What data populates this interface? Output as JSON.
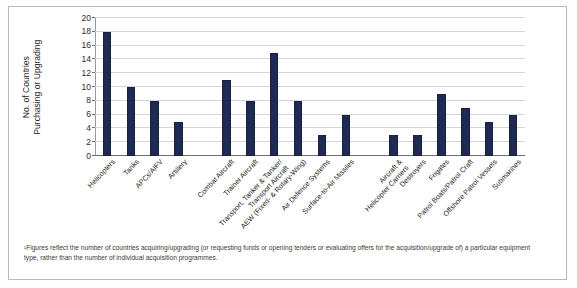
{
  "chart_data": {
    "type": "bar",
    "title": "",
    "xlabel": "",
    "ylabel": "No. of Countries Purchasing or Upgrading",
    "ylabel_lines": [
      "No. of Countries",
      "Purchasing or Upgrading"
    ],
    "ylim": [
      0,
      20
    ],
    "ytick_step": 2,
    "yticks": [
      0,
      2,
      4,
      6,
      8,
      10,
      12,
      14,
      16,
      18,
      20
    ],
    "ytick_labels": [
      "0",
      "2",
      "4",
      "6",
      "8",
      "10",
      "12",
      "14",
      "16",
      "18",
      "20"
    ],
    "grid": true,
    "grid_axis": "y",
    "legend": false,
    "bar_color": "#1e2a55",
    "categories": [
      "Helicopters",
      "Tanks",
      "APCs/AIFV",
      "Artillery",
      "Combat Aircraft",
      "Trainer Aircraft",
      "Transport, Tanker & Tanker/Transport Aircraft",
      "AEW (Fixed- & Rotary-Wing)",
      "Air Defence Systems",
      "Surface-to-Air Missiles",
      "Aircraft & Helicopter Carriers",
      "Destroyers",
      "Frigates",
      "Patrol Boats/Patrol Craft",
      "Offshore Patrol Vessels",
      "Submarines"
    ],
    "category_label_lines": [
      [
        "Helicopters"
      ],
      [
        "Tanks"
      ],
      [
        "APCs/AIFV"
      ],
      [
        "Artillery"
      ],
      [
        "Combat Aircraft"
      ],
      [
        "Trainer Aircraft"
      ],
      [
        "Transport, Tanker & Tanker/",
        "Transport Aircraft"
      ],
      [
        "AEW (Fixed- & Rotary-Wing)"
      ],
      [
        "Air Defence Systems"
      ],
      [
        "Surface-to-Air Missiles"
      ],
      [
        "Aircraft &",
        "Helicopter Carriers"
      ],
      [
        "Destroyers"
      ],
      [
        "Frigates"
      ],
      [
        "Patrol Boats/Patrol Craft"
      ],
      [
        "Offshore Patrol Vessels"
      ],
      [
        "Submarines"
      ]
    ],
    "values": [
      18,
      10,
      8,
      5,
      11,
      8,
      15,
      8,
      3,
      6,
      3,
      3,
      9,
      7,
      5,
      6
    ],
    "group_breaks": [
      4,
      10
    ]
  },
  "footnote": {
    "text": "¹Figures reflect the number of countries acquiring/upgrading (or requesting funds or opening tenders or evaluating offers for the acquisition/upgrade of) a particular equipment type, rather than the number of individual acquisition programmes."
  }
}
